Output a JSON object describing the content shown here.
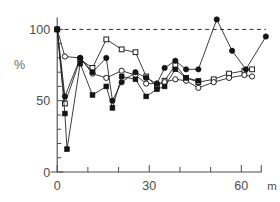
{
  "chart_data": {
    "type": "line",
    "title": "",
    "subtitle": "",
    "xlabel": "",
    "ylabel": "%",
    "x_unit": "m",
    "xlim": [
      -3,
      70
    ],
    "ylim": [
      0,
      108
    ],
    "grid": false,
    "legend_position": "none",
    "x_ticks": [
      0,
      10,
      20,
      30,
      40,
      50,
      60
    ],
    "x_tick_labels": [
      "0",
      "",
      "",
      "30",
      "",
      "",
      "60"
    ],
    "y_ticks": [
      0,
      10,
      20,
      30,
      40,
      50,
      60,
      70,
      80,
      90,
      100
    ],
    "y_tick_labels": [
      "0",
      "",
      "",
      "",
      "",
      "50",
      "",
      "",
      "",
      "",
      "100"
    ],
    "reference_line": {
      "label": "100% reference",
      "y": 100,
      "style": "dashed",
      "x_start": 0,
      "x_end": 68
    },
    "series": [
      {
        "name": "Series 1",
        "marker": "open-square",
        "points": [
          {
            "x": 0,
            "y": 100
          },
          {
            "x": 2.5,
            "y": 48
          },
          {
            "x": 7.5,
            "y": 79
          },
          {
            "x": 11.5,
            "y": 73
          },
          {
            "x": 16,
            "y": 93
          },
          {
            "x": 21,
            "y": 86
          },
          {
            "x": 25.5,
            "y": 84
          },
          {
            "x": 29,
            "y": 67
          },
          {
            "x": 32.5,
            "y": 60
          },
          {
            "x": 35,
            "y": 64
          },
          {
            "x": 38.5,
            "y": 75
          },
          {
            "x": 42,
            "y": 66
          },
          {
            "x": 46,
            "y": 63
          },
          {
            "x": 51,
            "y": 65
          },
          {
            "x": 56,
            "y": 69
          },
          {
            "x": 61,
            "y": 71
          },
          {
            "x": 63.5,
            "y": 72
          }
        ]
      },
      {
        "name": "Series 2",
        "marker": "open-circle",
        "points": [
          {
            "x": 0,
            "y": 100
          },
          {
            "x": 2.5,
            "y": 81
          },
          {
            "x": 7.5,
            "y": 80
          },
          {
            "x": 11.5,
            "y": 69
          },
          {
            "x": 16,
            "y": 66
          },
          {
            "x": 21,
            "y": 71
          },
          {
            "x": 25.5,
            "y": 68
          },
          {
            "x": 29,
            "y": 62
          },
          {
            "x": 32.5,
            "y": 62
          },
          {
            "x": 35,
            "y": 63
          },
          {
            "x": 38.5,
            "y": 65
          },
          {
            "x": 42,
            "y": 64
          },
          {
            "x": 46,
            "y": 59
          },
          {
            "x": 51,
            "y": 63
          },
          {
            "x": 56,
            "y": 66
          },
          {
            "x": 61,
            "y": 68
          },
          {
            "x": 63.5,
            "y": 67
          }
        ]
      },
      {
        "name": "Series 3",
        "marker": "filled-circle",
        "points": [
          {
            "x": 0,
            "y": 100
          },
          {
            "x": 2.5,
            "y": 53
          },
          {
            "x": 7.5,
            "y": 80
          },
          {
            "x": 11.5,
            "y": 70
          },
          {
            "x": 16,
            "y": 80
          },
          {
            "x": 18,
            "y": 50
          },
          {
            "x": 21,
            "y": 63
          },
          {
            "x": 25.5,
            "y": 70
          },
          {
            "x": 29,
            "y": 66
          },
          {
            "x": 32.5,
            "y": 62
          },
          {
            "x": 35,
            "y": 73
          },
          {
            "x": 38.5,
            "y": 78
          },
          {
            "x": 42,
            "y": 72
          },
          {
            "x": 46,
            "y": 72
          },
          {
            "x": 52,
            "y": 107
          },
          {
            "x": 57,
            "y": 85
          },
          {
            "x": 61.5,
            "y": 72
          },
          {
            "x": 68,
            "y": 95
          }
        ]
      },
      {
        "name": "Series 4",
        "marker": "filled-square",
        "points": [
          {
            "x": 0,
            "y": 100
          },
          {
            "x": 2.5,
            "y": 41
          },
          {
            "x": 3.2,
            "y": 16
          },
          {
            "x": 7.5,
            "y": 76
          },
          {
            "x": 11.5,
            "y": 54
          },
          {
            "x": 16,
            "y": 60
          },
          {
            "x": 18,
            "y": 45
          },
          {
            "x": 21,
            "y": 67
          },
          {
            "x": 25.5,
            "y": 65
          },
          {
            "x": 29,
            "y": 53
          },
          {
            "x": 32.5,
            "y": 58
          },
          {
            "x": 35,
            "y": 60
          },
          {
            "x": 38.5,
            "y": 72
          },
          {
            "x": 42,
            "y": 66
          },
          {
            "x": 46,
            "y": 64
          }
        ]
      }
    ]
  }
}
